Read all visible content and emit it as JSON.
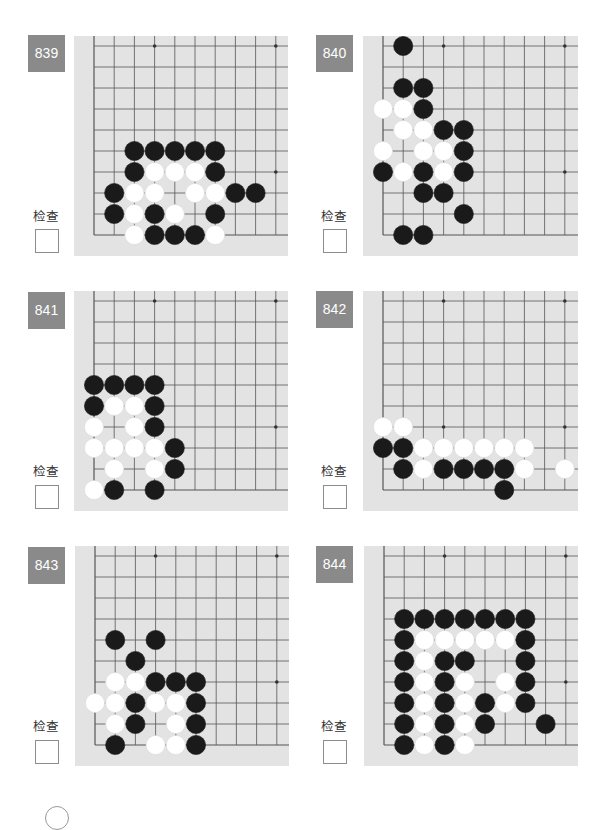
{
  "page": {
    "check_label": "检查",
    "colors": {
      "badge_bg": "#8a8a8a",
      "board_bg": "#e3e3e3",
      "grid_line": "#555555",
      "black_stone": "#1a1a1a",
      "white_stone": "#ffffff"
    }
  },
  "problems": [
    {
      "number": "839",
      "stones": {
        "black": [
          [
            3,
            0
          ],
          [
            4,
            0
          ],
          [
            5,
            0
          ],
          [
            1,
            1
          ],
          [
            3,
            1
          ],
          [
            6,
            1
          ],
          [
            1,
            2
          ],
          [
            7,
            2
          ],
          [
            8,
            2
          ],
          [
            2,
            3
          ],
          [
            6,
            3
          ],
          [
            2,
            4
          ],
          [
            3,
            4
          ],
          [
            4,
            4
          ],
          [
            5,
            4
          ],
          [
            6,
            4
          ]
        ],
        "white": [
          [
            2,
            0
          ],
          [
            6,
            0
          ],
          [
            2,
            1
          ],
          [
            4,
            1
          ],
          [
            2,
            2
          ],
          [
            3,
            2
          ],
          [
            5,
            2
          ],
          [
            6,
            2
          ],
          [
            3,
            3
          ],
          [
            4,
            3
          ],
          [
            5,
            3
          ]
        ]
      }
    },
    {
      "number": "840",
      "stones": {
        "black": [
          [
            1,
            0
          ],
          [
            2,
            0
          ],
          [
            4,
            1
          ],
          [
            2,
            2
          ],
          [
            3,
            2
          ],
          [
            0,
            3
          ],
          [
            2,
            3
          ],
          [
            4,
            3
          ],
          [
            4,
            4
          ],
          [
            3,
            5
          ],
          [
            4,
            5
          ],
          [
            2,
            6
          ],
          [
            1,
            7
          ],
          [
            2,
            7
          ],
          [
            1,
            9
          ]
        ],
        "white": [
          [
            1,
            3
          ],
          [
            3,
            3
          ],
          [
            0,
            4
          ],
          [
            2,
            4
          ],
          [
            3,
            4
          ],
          [
            1,
            5
          ],
          [
            2,
            5
          ],
          [
            0,
            6
          ],
          [
            1,
            6
          ]
        ]
      }
    },
    {
      "number": "841",
      "stones": {
        "black": [
          [
            1,
            0
          ],
          [
            3,
            0
          ],
          [
            4,
            1
          ],
          [
            4,
            2
          ],
          [
            3,
            3
          ],
          [
            0,
            4
          ],
          [
            3,
            4
          ],
          [
            0,
            5
          ],
          [
            1,
            5
          ],
          [
            2,
            5
          ],
          [
            3,
            5
          ]
        ],
        "white": [
          [
            0,
            0
          ],
          [
            1,
            1
          ],
          [
            3,
            1
          ],
          [
            0,
            2
          ],
          [
            1,
            2
          ],
          [
            2,
            2
          ],
          [
            3,
            2
          ],
          [
            0,
            3
          ],
          [
            2,
            3
          ],
          [
            1,
            4
          ],
          [
            2,
            4
          ]
        ]
      }
    },
    {
      "number": "842",
      "stones": {
        "black": [
          [
            6,
            0
          ],
          [
            1,
            1
          ],
          [
            3,
            1
          ],
          [
            4,
            1
          ],
          [
            5,
            1
          ],
          [
            6,
            1
          ],
          [
            0,
            2
          ],
          [
            1,
            2
          ]
        ],
        "white": [
          [
            2,
            1
          ],
          [
            7,
            1
          ],
          [
            9,
            1
          ],
          [
            2,
            2
          ],
          [
            3,
            2
          ],
          [
            4,
            2
          ],
          [
            5,
            2
          ],
          [
            6,
            2
          ],
          [
            7,
            2
          ],
          [
            0,
            3
          ],
          [
            1,
            3
          ]
        ]
      }
    },
    {
      "number": "843",
      "stones": {
        "black": [
          [
            1,
            0
          ],
          [
            5,
            0
          ],
          [
            2,
            1
          ],
          [
            5,
            1
          ],
          [
            2,
            2
          ],
          [
            5,
            2
          ],
          [
            3,
            3
          ],
          [
            4,
            3
          ],
          [
            5,
            3
          ],
          [
            2,
            4
          ],
          [
            1,
            5
          ],
          [
            3,
            5
          ]
        ],
        "white": [
          [
            3,
            0
          ],
          [
            4,
            0
          ],
          [
            1,
            1
          ],
          [
            4,
            1
          ],
          [
            0,
            2
          ],
          [
            1,
            2
          ],
          [
            3,
            2
          ],
          [
            4,
            2
          ],
          [
            1,
            3
          ],
          [
            2,
            3
          ]
        ]
      }
    },
    {
      "number": "844",
      "stones": {
        "black": [
          [
            1,
            0
          ],
          [
            3,
            0
          ],
          [
            1,
            1
          ],
          [
            3,
            1
          ],
          [
            5,
            1
          ],
          [
            8,
            1
          ],
          [
            1,
            2
          ],
          [
            3,
            2
          ],
          [
            5,
            2
          ],
          [
            7,
            2
          ],
          [
            1,
            3
          ],
          [
            3,
            3
          ],
          [
            7,
            3
          ],
          [
            1,
            4
          ],
          [
            3,
            4
          ],
          [
            4,
            4
          ],
          [
            7,
            4
          ],
          [
            1,
            5
          ],
          [
            7,
            5
          ],
          [
            1,
            6
          ],
          [
            2,
            6
          ],
          [
            3,
            6
          ],
          [
            4,
            6
          ],
          [
            5,
            6
          ],
          [
            6,
            6
          ],
          [
            7,
            6
          ]
        ],
        "white": [
          [
            2,
            0
          ],
          [
            4,
            0
          ],
          [
            2,
            1
          ],
          [
            4,
            1
          ],
          [
            2,
            2
          ],
          [
            4,
            2
          ],
          [
            6,
            2
          ],
          [
            2,
            3
          ],
          [
            4,
            3
          ],
          [
            6,
            3
          ],
          [
            2,
            4
          ],
          [
            2,
            5
          ],
          [
            3,
            5
          ],
          [
            4,
            5
          ],
          [
            5,
            5
          ],
          [
            6,
            5
          ]
        ]
      }
    }
  ]
}
